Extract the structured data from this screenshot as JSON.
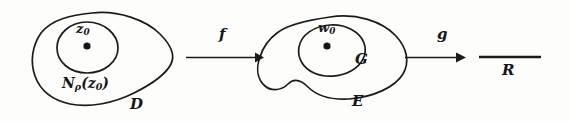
{
  "diagram": {
    "type": "mathematical-mapping-diagram",
    "regions": [
      {
        "id": "domain-D",
        "label": "D",
        "inner_label": "N",
        "inner_sub": "ρ",
        "inner_arg": "(z",
        "inner_arg_sub": "0",
        "inner_arg_close": ")",
        "point_label": "z",
        "point_sub": "0"
      },
      {
        "id": "region-E",
        "label": "E",
        "inner_label": "G",
        "point_label": "w",
        "point_sub": "0"
      },
      {
        "id": "real-line-R",
        "label": "R"
      }
    ],
    "arrows": [
      {
        "id": "map-f",
        "label": "f"
      },
      {
        "id": "map-g",
        "label": "g"
      }
    ],
    "labels": {
      "z0_base": "z",
      "z0_sub": "0",
      "n_base": "N",
      "n_sub": "ρ",
      "n_open": "(z",
      "n_arg_sub": "0",
      "n_close": ")",
      "D": "D",
      "f": "f",
      "w0_base": "w",
      "w0_sub": "0",
      "G": "G",
      "E": "E",
      "g": "g",
      "R": "R"
    },
    "colors": {
      "ink": "#1b1b1b",
      "background": "#fdfdfc",
      "dot": "#151515"
    }
  }
}
